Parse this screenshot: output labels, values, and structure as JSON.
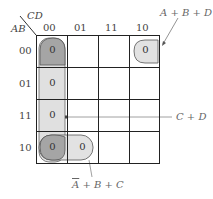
{
  "kmap": {
    "row_var": "AB",
    "col_var": "CD",
    "col_labels": [
      "00",
      "01",
      "11",
      "10"
    ],
    "row_labels": [
      "00",
      "01",
      "11",
      "10"
    ],
    "cells": [
      {
        "row": 0,
        "col": 0,
        "value": "0"
      },
      {
        "row": 0,
        "col": 3,
        "value": "0"
      },
      {
        "row": 1,
        "col": 0,
        "value": "0"
      },
      {
        "row": 2,
        "col": 0,
        "value": "0"
      },
      {
        "row": 3,
        "col": 0,
        "value": "0"
      },
      {
        "row": 3,
        "col": 1,
        "value": "0"
      }
    ]
  },
  "groups": [
    {
      "label": "A + B + D",
      "cells": "row 00, col 00 and col 10 (wrap)"
    },
    {
      "label": "C + D",
      "cells": "column 00, all rows"
    },
    {
      "label_prefix": "A",
      "label_rest": " + B + C",
      "overline": "A",
      "cells": "row 10, cols 00-01"
    }
  ],
  "colors": {
    "group_light": "#e2e2e2",
    "group_dark": "#a9a9a9",
    "grid": "#222222"
  }
}
